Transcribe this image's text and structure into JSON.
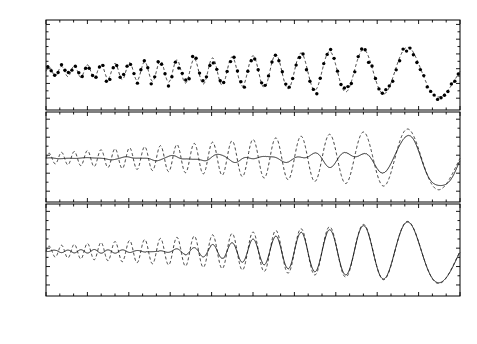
{
  "figure": {
    "width": 477,
    "height": 344,
    "background": "#ffffff",
    "line_color": "#1a1a1a",
    "marker_color": "#000000"
  },
  "axes": {
    "x": {
      "label": "s",
      "min": 0,
      "max": 1,
      "ticks": [
        0,
        0.1,
        0.2,
        0.3,
        0.4,
        0.5,
        0.6,
        0.7,
        0.8,
        0.9,
        1
      ],
      "tick_labels": [
        "0",
        "0.1",
        "0.2",
        "0.3",
        "0.4",
        "0.5",
        "0.6",
        "0.7",
        "0.8",
        "0.9",
        "1"
      ],
      "minor_ticks_per_interval": 2
    },
    "y_label": "f(s)"
  },
  "panels": [
    {
      "tag": "(a)",
      "ylim": [
        -5.6,
        6.6
      ],
      "yticks": [
        -4,
        -2,
        0,
        2,
        4,
        6
      ],
      "ytick_labels": [
        "-4",
        "-2",
        "0",
        "2",
        "4",
        "6"
      ],
      "series": [
        "observed-data-points",
        "true-signal-dashed"
      ]
    },
    {
      "tag": "(b)",
      "ylim": [
        -5.2,
        4.8
      ],
      "yticks": [
        -4,
        -2,
        0,
        2,
        4
      ],
      "ytick_labels": [
        "-4",
        "-2",
        "0",
        "2",
        "4"
      ],
      "series": [
        "true-signal-dashed",
        "poor-fit-solid"
      ]
    },
    {
      "tag": "(c)",
      "ylim": [
        -5.2,
        4.8
      ],
      "yticks": [
        -4,
        -2,
        0,
        2,
        4
      ],
      "ytick_labels": [
        "-4",
        "-2",
        "0",
        "2",
        "4"
      ],
      "series": [
        "true-signal-dashed",
        "good-fit-solid"
      ]
    }
  ],
  "chart_data": {
    "type": "line",
    "title": "",
    "xlabel": "s",
    "ylabel": "f(s)",
    "xlim": [
      0,
      1
    ],
    "grid": false,
    "legend": "none",
    "signal_model": {
      "form": "A(s)*sin(phi(s))",
      "amplitude": "amp0 + amp1*s",
      "amp0": 0.55,
      "amp1": 3.1,
      "phase": "2*pi*(f0*s - k*s*s/2)",
      "f0": 34.0,
      "k": 30.0,
      "offset": -0.35
    },
    "panels": [
      {
        "tag": "(a)",
        "ylim": [
          -5.6,
          6.6
        ],
        "yticks": [
          -4,
          -2,
          0,
          2,
          4,
          6
        ],
        "n_points": 120,
        "noise_amplitude": 0.55,
        "curve_style": "dashed",
        "marker": "filled-circle"
      },
      {
        "tag": "(b)",
        "ylim": [
          -5.2,
          4.8
        ],
        "yticks": [
          -4,
          -2,
          0,
          2,
          4
        ],
        "reference_style": "dashed",
        "fit_style": "solid",
        "fit_quality": "poor",
        "fit_lowpass_cutoff_s": 0.33,
        "fit_wiggle_amp": 0.3
      },
      {
        "tag": "(c)",
        "ylim": [
          -5.2,
          4.8
        ],
        "yticks": [
          -4,
          -2,
          0,
          2,
          4
        ],
        "reference_style": "dashed",
        "fit_style": "solid",
        "fit_quality": "good",
        "fit_lowpass_cutoff_s": 0.045,
        "fit_wiggle_amp": 0.05
      }
    ]
  }
}
